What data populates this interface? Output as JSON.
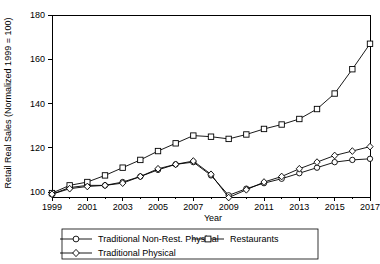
{
  "chart_data": {
    "type": "line",
    "title": "",
    "xlabel": "Year",
    "ylabel": "Retail Real Sales (Normalized 1999 = 100)",
    "xlim": [
      1999,
      2017
    ],
    "ylim": [
      92,
      180
    ],
    "grid": false,
    "legend_position": "bottom",
    "xticks": [
      1999,
      2001,
      2003,
      2005,
      2007,
      2009,
      2011,
      2013,
      2015,
      2017
    ],
    "xtick_labels": [
      "1999",
      "2001",
      "2003",
      "2005",
      "2007",
      "2009",
      "2011",
      "2013",
      "2015",
      "2017"
    ],
    "yticks": [
      100,
      120,
      140,
      160,
      180
    ],
    "ytick_labels": [
      "100",
      "120",
      "140",
      "160",
      "180"
    ],
    "x": [
      1999,
      2000,
      2001,
      2002,
      2003,
      2004,
      2005,
      2006,
      2007,
      2008,
      2009,
      2010,
      2011,
      2012,
      2013,
      2014,
      2015,
      2016,
      2017
    ],
    "series": [
      {
        "name": "Traditional Non-Rest. Physical",
        "marker": "circle",
        "values": [
          99.0,
          102.0,
          103.0,
          103.0,
          104.5,
          107.0,
          110.0,
          112.5,
          113.5,
          107.5,
          98.5,
          101.5,
          104.0,
          106.0,
          108.5,
          111.0,
          113.5,
          114.5,
          115.0
        ]
      },
      {
        "name": "Restaurants",
        "marker": "square",
        "values": [
          99.5,
          103.0,
          104.5,
          107.5,
          111.0,
          114.5,
          118.5,
          122.0,
          125.5,
          125.0,
          124.0,
          126.0,
          128.5,
          130.5,
          133.0,
          137.5,
          144.5,
          155.5,
          167.0
        ]
      },
      {
        "name": "Traditional Physical",
        "marker": "diamond",
        "values": [
          99.0,
          101.5,
          102.5,
          103.0,
          104.0,
          107.0,
          110.5,
          112.5,
          114.0,
          108.0,
          97.5,
          101.0,
          104.5,
          107.0,
          110.5,
          113.5,
          116.5,
          118.5,
          120.5
        ]
      }
    ]
  },
  "legend": {
    "entries": [
      {
        "label": "Traditional Non-Rest. Physical",
        "marker": "circle"
      },
      {
        "label": "Restaurants",
        "marker": "square"
      },
      {
        "label": "Traditional Physical",
        "marker": "diamond"
      }
    ]
  }
}
